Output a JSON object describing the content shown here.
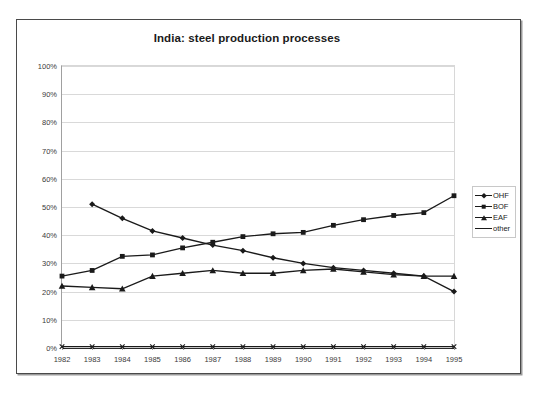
{
  "chart_data": {
    "type": "line",
    "title": "India: steel production processes",
    "xlabel": "",
    "ylabel": "",
    "x": [
      1982,
      1983,
      1984,
      1985,
      1986,
      1987,
      1988,
      1989,
      1990,
      1991,
      1992,
      1993,
      1994,
      1995
    ],
    "xtick_labels": [
      "1982",
      "1983",
      "1984",
      "1985",
      "1986",
      "1987",
      "1988",
      "1989",
      "1990",
      "1991",
      "1992",
      "1993",
      "1994",
      "1995"
    ],
    "ytick_labels": [
      "0%",
      "10%",
      "20%",
      "30%",
      "40%",
      "50%",
      "60%",
      "70%",
      "80%",
      "90%",
      "100%"
    ],
    "ytick_values": [
      0,
      10,
      20,
      30,
      40,
      50,
      60,
      70,
      80,
      90,
      100
    ],
    "ylim": [
      0,
      100
    ],
    "grid": true,
    "legend_position": "right",
    "series": [
      {
        "name": "OHF",
        "marker": "diamond",
        "values": [
          null,
          51.0,
          46.0,
          41.5,
          39.0,
          36.5,
          34.5,
          32.0,
          30.0,
          28.5,
          27.5,
          26.5,
          25.5,
          20.0
        ]
      },
      {
        "name": "BOF",
        "marker": "square",
        "values": [
          25.5,
          27.5,
          32.5,
          33.0,
          35.5,
          37.5,
          39.5,
          40.5,
          41.0,
          43.5,
          45.5,
          47.0,
          48.0,
          54.0
        ]
      },
      {
        "name": "EAF",
        "marker": "triangle",
        "values": [
          22.0,
          21.5,
          21.0,
          25.5,
          26.5,
          27.5,
          26.5,
          26.5,
          27.5,
          28.0,
          27.0,
          26.0,
          25.5,
          25.5
        ]
      },
      {
        "name": "other",
        "marker": "x",
        "values": [
          0.5,
          0.5,
          0.5,
          0.5,
          0.5,
          0.5,
          0.5,
          0.5,
          0.5,
          0.5,
          0.5,
          0.5,
          0.5,
          0.5
        ]
      }
    ]
  },
  "legend": {
    "items": [
      {
        "label": "OHF"
      },
      {
        "label": "BOF"
      },
      {
        "label": "EAF"
      },
      {
        "label": "other"
      }
    ]
  },
  "colors": {
    "series": "#1a1a1a",
    "grid": "#d9d9d9",
    "axis": "#2b2b2b",
    "frame": "#4a4a4a"
  }
}
